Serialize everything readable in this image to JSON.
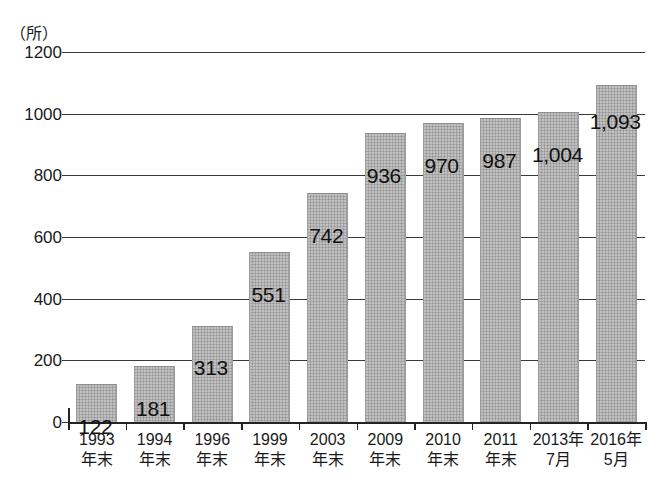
{
  "chart_data": {
    "type": "bar",
    "title": "",
    "subtitle": "",
    "unit_label": "（所）",
    "xlabel": "",
    "ylabel": "",
    "ylim": [
      0,
      1200
    ],
    "yticks": [
      0,
      200,
      400,
      600,
      800,
      1000,
      1200
    ],
    "ytick_labels": [
      "0",
      "200",
      "400",
      "600",
      "800",
      "1000",
      "1200"
    ],
    "grid": true,
    "legend": null,
    "categories": [
      "1993年末",
      "1994年末",
      "1996年末",
      "1999年末",
      "2003年末",
      "2009年末",
      "2010年末",
      "2011年末",
      "2013年7月",
      "2016年5月"
    ],
    "category_lines": [
      [
        "1993",
        "年末"
      ],
      [
        "1994",
        "年末"
      ],
      [
        "1996",
        "年末"
      ],
      [
        "1999",
        "年末"
      ],
      [
        "2003",
        "年末"
      ],
      [
        "2009",
        "年末"
      ],
      [
        "2010",
        "年末"
      ],
      [
        "2011",
        "年末"
      ],
      [
        "2013年",
        "7月"
      ],
      [
        "2016年",
        "5月"
      ]
    ],
    "values": [
      122,
      181,
      313,
      551,
      742,
      936,
      970,
      987,
      1004,
      1093
    ],
    "value_labels": [
      "122",
      "181",
      "313",
      "551",
      "742",
      "936",
      "970",
      "987",
      "1,004",
      "1,093"
    ],
    "bar_color": "#a6a6a6",
    "axis_color": "#242424",
    "grid_color": "#3a3a3a",
    "text_color": "#1a1a1a"
  }
}
